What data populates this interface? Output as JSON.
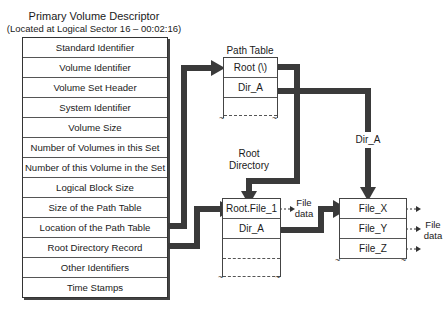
{
  "descriptor": {
    "title": "Primary Volume Descriptor",
    "subtitle": "(Located at Logical Sector 16 – 00:02:16)",
    "fields": [
      "Standard Identifier",
      "Volume Identifier",
      "Volume Set Header",
      "System Identifier",
      "Volume Size",
      "Number of Volumes in this Set",
      "Number of this Volume in the Set",
      "Logical Block Size",
      "Size of the Path Table",
      "Location of the Path Table",
      "Root Directory Record",
      "Other Identifiers",
      "Time Stamps"
    ]
  },
  "path_table": {
    "title": "Path Table",
    "entries": [
      "Root (\\)",
      "Dir_A"
    ]
  },
  "root_directory": {
    "label_line1": "Root",
    "label_line2": "Directory",
    "entries": [
      "Root.File_1",
      "Dir_A"
    ],
    "file_data_line1": "File",
    "file_data_line2": "data"
  },
  "dir_a": {
    "arrow_label": "Dir_A",
    "entries": [
      "File_X",
      "File_Y",
      "File_Z"
    ],
    "file_data_line1": "File",
    "file_data_line2": "data"
  },
  "colors": {
    "arrow": "#3a3a3a",
    "border": "#444444"
  }
}
